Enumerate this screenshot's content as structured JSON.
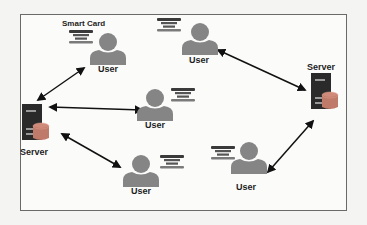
{
  "diagram": {
    "title_label": "Smart Card",
    "card_text_line1": "Smart",
    "card_text_line2": "Card",
    "colors": {
      "person": "#858585",
      "server_body": "#2a2a2a",
      "server_slot": "#9a9a9a",
      "database": "#c07a6a",
      "arrow": "#111111",
      "card_bar": "#3a3a3a",
      "card_stripe": "#7a7a7a"
    },
    "nodes": [
      {
        "id": "user-top-left",
        "type": "user",
        "label": "User",
        "x": 108,
        "y": 56
      },
      {
        "id": "user-top-center",
        "type": "user",
        "label": "User",
        "x": 199,
        "y": 46
      },
      {
        "id": "user-center",
        "type": "user",
        "label": "User",
        "x": 155,
        "y": 112
      },
      {
        "id": "user-bottom-center",
        "type": "user",
        "label": "User",
        "x": 141,
        "y": 178
      },
      {
        "id": "user-bottom-right",
        "type": "user",
        "label": "User",
        "x": 250,
        "y": 165
      },
      {
        "id": "server-left",
        "type": "server",
        "label": "Server",
        "x": 34,
        "y": 130
      },
      {
        "id": "server-right",
        "type": "server",
        "label": "Server",
        "x": 322,
        "y": 88
      }
    ],
    "edges": [
      {
        "from": "server-left",
        "to": "user-top-left",
        "bidirectional": true
      },
      {
        "from": "server-left",
        "to": "user-center",
        "bidirectional": true
      },
      {
        "from": "server-left",
        "to": "user-bottom-center",
        "bidirectional": true
      },
      {
        "from": "server-right",
        "to": "user-top-center",
        "bidirectional": true
      },
      {
        "from": "server-right",
        "to": "user-bottom-right",
        "bidirectional": true
      }
    ],
    "labels": {
      "user_top_left": "User",
      "user_top_center": "User",
      "user_center": "User",
      "user_bottom_center": "User",
      "user_bottom_right": "User",
      "server_left": "Server",
      "server_right": "Server"
    }
  }
}
